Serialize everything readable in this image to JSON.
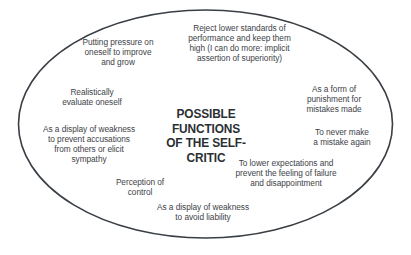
{
  "diagram": {
    "title": "POSSIBLE FUNCTIONS\nOF THE SELF-CRITIC",
    "shape": "ellipse",
    "colors": {
      "background": "#ffffff",
      "outline": "#3a3f45",
      "title_text": "#2b2f33",
      "note_text": "#3d4247"
    },
    "notes": [
      {
        "id": "note-pressure-improve",
        "text": "Putting pressure on\noneself to improve\nand grow"
      },
      {
        "id": "note-reject-lower-standards",
        "text": "Reject lower standards of\nperformance and keep them\nhigh (I can do more: implicit\nassertion of superiority)"
      },
      {
        "id": "note-realistic-evaluation",
        "text": "Realistically\nevaluate oneself"
      },
      {
        "id": "note-display-weakness-accusations",
        "text": "As a display of weakness\nto prevent accusations\nfrom others or elicit\nsympathy"
      },
      {
        "id": "note-form-of-punishment",
        "text": "As a form of\npunishment for\nmistakes made"
      },
      {
        "id": "note-never-mistake-again",
        "text": "To never make\na mistake again"
      },
      {
        "id": "note-lower-expectations",
        "text": "To lower expectations and\nprevent the feeling of failure\nand disappointment"
      },
      {
        "id": "note-perception-of-control",
        "text": "Perception of\ncontrol"
      },
      {
        "id": "note-display-weakness-liability",
        "text": "As a display of weakness\nto avoid liability"
      }
    ]
  }
}
